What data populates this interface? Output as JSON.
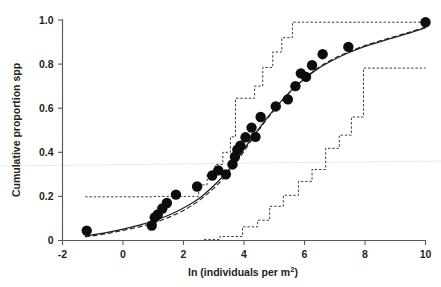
{
  "chart_data": {
    "type": "scatter",
    "title": "",
    "subtitle": "",
    "xlabel": "ln (individuals per m2)",
    "xlabel_base": "ln (individuals per m",
    "xlabel_sup": "2",
    "xlabel_tail": ")",
    "ylabel": "Cumulative proportion spp",
    "xlim": [
      -2,
      10
    ],
    "ylim": [
      0,
      1.0
    ],
    "xticks": [
      -2,
      0,
      2,
      4,
      6,
      8,
      10
    ],
    "xticklabels": [
      "-2",
      "0",
      "2",
      "4",
      "6",
      "8",
      "10"
    ],
    "yticks": [
      0,
      0.2,
      0.4,
      0.6,
      0.8,
      1.0
    ],
    "yticklabels": [
      "0",
      "0.2",
      "0.4",
      "0.6",
      "0.8",
      "1.0"
    ],
    "grid": false,
    "legend": false,
    "legend_position": "none",
    "series": [
      {
        "name": "Observed cumulative proportion",
        "type": "scatter",
        "marker": "filled-circle",
        "marker_color": "#0d0d0d",
        "marker_size_px": 5.2,
        "points": [
          [
            -1.2,
            0.045
          ],
          [
            0.95,
            0.068
          ],
          [
            1.05,
            0.105
          ],
          [
            1.15,
            0.118
          ],
          [
            1.3,
            0.145
          ],
          [
            1.45,
            0.17
          ],
          [
            1.75,
            0.208
          ],
          [
            2.45,
            0.245
          ],
          [
            2.95,
            0.295
          ],
          [
            3.15,
            0.318
          ],
          [
            3.4,
            0.3
          ],
          [
            3.62,
            0.345
          ],
          [
            3.7,
            0.38
          ],
          [
            3.78,
            0.412
          ],
          [
            3.88,
            0.43
          ],
          [
            4.05,
            0.468
          ],
          [
            4.25,
            0.512
          ],
          [
            4.38,
            0.47
          ],
          [
            4.55,
            0.56
          ],
          [
            5.05,
            0.608
          ],
          [
            5.45,
            0.64
          ],
          [
            5.7,
            0.7
          ],
          [
            5.88,
            0.758
          ],
          [
            6.05,
            0.742
          ],
          [
            6.25,
            0.795
          ],
          [
            6.6,
            0.845
          ],
          [
            7.45,
            0.878
          ],
          [
            10.0,
            0.99
          ]
        ]
      },
      {
        "name": "Fitted model (solid)",
        "type": "line",
        "style": "solid",
        "color": "#231f20",
        "points": [
          [
            -1.25,
            0.02
          ],
          [
            -0.6,
            0.035
          ],
          [
            0.0,
            0.052
          ],
          [
            0.6,
            0.072
          ],
          [
            1.1,
            0.093
          ],
          [
            1.6,
            0.12
          ],
          [
            2.1,
            0.155
          ],
          [
            2.6,
            0.2
          ],
          [
            3.1,
            0.262
          ],
          [
            3.5,
            0.322
          ],
          [
            3.9,
            0.395
          ],
          [
            4.3,
            0.472
          ],
          [
            4.7,
            0.545
          ],
          [
            5.1,
            0.612
          ],
          [
            5.5,
            0.672
          ],
          [
            5.9,
            0.722
          ],
          [
            6.4,
            0.775
          ],
          [
            6.9,
            0.815
          ],
          [
            7.4,
            0.848
          ],
          [
            8.0,
            0.88
          ],
          [
            8.7,
            0.91
          ],
          [
            9.4,
            0.938
          ],
          [
            10.0,
            0.965
          ]
        ]
      },
      {
        "name": "Fitted model (dashed)",
        "type": "line",
        "style": "dashed",
        "color": "#231f20",
        "points": [
          [
            -1.25,
            0.016
          ],
          [
            -0.6,
            0.03
          ],
          [
            0.0,
            0.046
          ],
          [
            0.6,
            0.064
          ],
          [
            1.1,
            0.084
          ],
          [
            1.6,
            0.11
          ],
          [
            2.1,
            0.144
          ],
          [
            2.6,
            0.19
          ],
          [
            3.1,
            0.25
          ],
          [
            3.5,
            0.31
          ],
          [
            3.9,
            0.385
          ],
          [
            4.3,
            0.465
          ],
          [
            4.7,
            0.54
          ],
          [
            5.1,
            0.608
          ],
          [
            5.5,
            0.67
          ],
          [
            5.9,
            0.722
          ],
          [
            6.4,
            0.778
          ],
          [
            6.9,
            0.82
          ],
          [
            7.4,
            0.852
          ],
          [
            8.0,
            0.884
          ],
          [
            8.7,
            0.914
          ],
          [
            9.4,
            0.942
          ],
          [
            10.0,
            0.968
          ]
        ]
      },
      {
        "name": "Upper confidence band (step)",
        "type": "step",
        "style": "dotted",
        "color": "#3c3c3e",
        "points": [
          [
            -1.25,
            0.198
          ],
          [
            0.95,
            0.198
          ],
          [
            0.95,
            0.2
          ],
          [
            2.5,
            0.2
          ],
          [
            2.5,
            0.252
          ],
          [
            2.78,
            0.252
          ],
          [
            2.78,
            0.3
          ],
          [
            3.05,
            0.3
          ],
          [
            3.05,
            0.345
          ],
          [
            3.3,
            0.345
          ],
          [
            3.3,
            0.4
          ],
          [
            3.55,
            0.4
          ],
          [
            3.55,
            0.47
          ],
          [
            3.72,
            0.47
          ],
          [
            3.72,
            0.645
          ],
          [
            4.35,
            0.645
          ],
          [
            4.35,
            0.7
          ],
          [
            4.62,
            0.7
          ],
          [
            4.62,
            0.785
          ],
          [
            4.95,
            0.785
          ],
          [
            4.95,
            0.855
          ],
          [
            5.25,
            0.855
          ],
          [
            5.25,
            0.92
          ],
          [
            5.6,
            0.92
          ],
          [
            5.6,
            0.99
          ],
          [
            10.0,
            0.99
          ]
        ]
      },
      {
        "name": "Lower confidence band (step)",
        "type": "step",
        "style": "dotted",
        "color": "#3c3c3e",
        "points": [
          [
            2.68,
            0.005
          ],
          [
            3.2,
            0.005
          ],
          [
            3.2,
            0.018
          ],
          [
            3.95,
            0.018
          ],
          [
            3.95,
            0.062
          ],
          [
            4.45,
            0.062
          ],
          [
            4.45,
            0.092
          ],
          [
            4.85,
            0.092
          ],
          [
            4.85,
            0.155
          ],
          [
            5.3,
            0.155
          ],
          [
            5.3,
            0.205
          ],
          [
            5.8,
            0.205
          ],
          [
            5.8,
            0.268
          ],
          [
            6.25,
            0.268
          ],
          [
            6.25,
            0.322
          ],
          [
            6.7,
            0.322
          ],
          [
            6.7,
            0.418
          ],
          [
            7.15,
            0.418
          ],
          [
            7.15,
            0.478
          ],
          [
            7.55,
            0.478
          ],
          [
            7.55,
            0.56
          ],
          [
            7.95,
            0.56
          ],
          [
            7.95,
            0.782
          ],
          [
            10.0,
            0.782
          ]
        ]
      }
    ],
    "annotations": []
  }
}
